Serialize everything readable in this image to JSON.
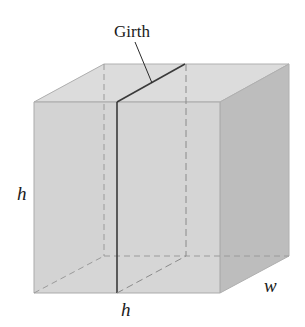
{
  "diagram": {
    "labels": {
      "girth": "Girth",
      "height_left": "h",
      "height_bottom": "h",
      "width": "w"
    },
    "colors": {
      "front_face": "#d6d6d6",
      "top_face": "#dedede",
      "right_face": "#b9b9b9",
      "bottom_face": "#e6e6e6",
      "left_face": "#cfcfcf",
      "edge": "#a8a8a8",
      "girth_line": "#3a3a3a"
    }
  }
}
